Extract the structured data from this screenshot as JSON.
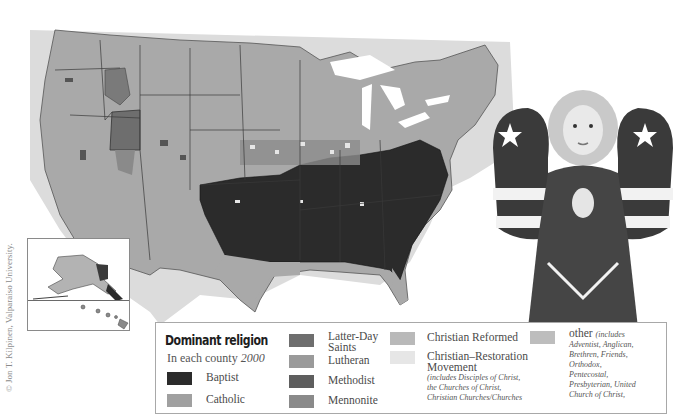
{
  "credit": "© Jon T. Kilpinen, Valparaiso University.",
  "map": {
    "subject": "United States counties",
    "insets": [
      "Alaska",
      "Hawaii"
    ],
    "shading": "grayscale choropleth",
    "colors": {
      "land_background": "#dcdcdc",
      "lakes_ocean": "#ffffff",
      "county_border": "#7a7a7a",
      "state_border": "#3a3a3a"
    }
  },
  "legend": {
    "title": "Dominant religion",
    "subtitle_prefix": "In each county",
    "subtitle_year": "2000",
    "items": [
      {
        "label": "Baptist",
        "color": "#2b2b2b"
      },
      {
        "label": "Catholic",
        "color": "#a0a0a0",
        "partially_visible": true
      },
      {
        "label": "Latter-Day",
        "label2": "Saints",
        "color": "#6e6e6e"
      },
      {
        "label": "Lutheran",
        "color": "#9a9a9a"
      },
      {
        "label": "Methodist",
        "color": "#5e5e5e"
      },
      {
        "label": "Mennonite",
        "color": "#8a8a8a",
        "partially_visible": true
      },
      {
        "label": "Christian Reformed",
        "color": "#b9b9b9"
      },
      {
        "label": "Christian–Restoration",
        "label2": "Movement",
        "color": "#e6e6e6",
        "note_lines": [
          "(includes Disciples of Christ,",
          "the Churches of Christ,",
          "Christian Churches/Churches"
        ]
      },
      {
        "label": "other",
        "label_suffix": "(includes",
        "color": "#bdbdbd",
        "note_lines": [
          "Adventist, Anglican,",
          "Brethren, Friends,",
          "Orthodox,",
          "Pentecostal,",
          "Presbyterian, United",
          "Church of Christ,"
        ]
      }
    ]
  },
  "photo": {
    "description": "ceramic angel figurine praying, with stars-and-stripes wings"
  }
}
